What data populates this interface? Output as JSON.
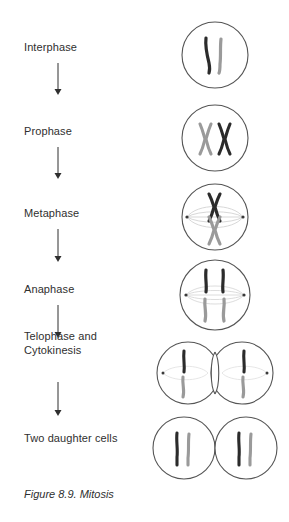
{
  "figure": {
    "caption": "Figure 8.9. Mitosis",
    "title": "Mitosis",
    "number": "Figure 8.9."
  },
  "colors": {
    "chromosome_dark": "#2b2b2b",
    "chromosome_light": "#9a9a9a",
    "cell_membrane": "#555555",
    "spindle": "#cfcfcf",
    "centrosome": "#3a3a3a",
    "text": "#2f2f2f",
    "arrow": "#2f2f2f",
    "background": "#ffffff"
  },
  "stages": [
    {
      "id": "interphase",
      "label": "Interphase",
      "label_x": 24,
      "label_y": 47,
      "cell_cx": 215,
      "cell_cy": 55,
      "cell_r": 33,
      "chromosome_shape": "uncondensed-strands",
      "chromosome_count": 2,
      "has_spindle": false,
      "has_centrosomes": false
    },
    {
      "id": "prophase",
      "label": "Prophase",
      "label_x": 24,
      "label_y": 131,
      "cell_cx": 215,
      "cell_cy": 138,
      "cell_r": 33,
      "chromosome_shape": "condensed-x-pair-side-by-side",
      "chromosome_count": 2,
      "has_spindle": false,
      "has_centrosomes": false
    },
    {
      "id": "metaphase",
      "label": "Metaphase",
      "label_x": 24,
      "label_y": 213,
      "cell_cx": 215,
      "cell_cy": 217,
      "cell_r": 33,
      "chromosome_shape": "condensed-x-aligned-equator",
      "chromosome_count": 2,
      "has_spindle": true,
      "has_centrosomes": true
    },
    {
      "id": "anaphase",
      "label": "Anaphase",
      "label_x": 24,
      "label_y": 289,
      "cell_cx": 215,
      "cell_cy": 295,
      "cell_r": 35,
      "chromosome_shape": "separated-chromatids",
      "chromosome_count": 4,
      "has_spindle": true,
      "has_centrosomes": true
    },
    {
      "id": "telophase-cytokinesis",
      "label": "Telophase and\nCytokinesis",
      "label_x": 24,
      "label_y": 336,
      "cell_cx": 215,
      "cell_cy": 373,
      "cell_r": 31,
      "chromosome_shape": "two-nuclei-cleavage-furrow",
      "chromosome_count": 4,
      "has_spindle": true,
      "has_centrosomes": true
    },
    {
      "id": "two-daughter-cells",
      "label": "Two daughter cells",
      "label_x": 24,
      "label_y": 438,
      "cell_cx": 215,
      "cell_cy": 448,
      "cell_r": 31,
      "chromosome_shape": "uncondensed-strands-two-cells",
      "chromosome_count": 4,
      "has_spindle": false,
      "has_centrosomes": false
    }
  ],
  "arrows": [
    {
      "id": "arrow-interphase-prophase",
      "x": 58,
      "y1": 63,
      "y2": 94
    },
    {
      "id": "arrow-prophase-metaphase",
      "x": 58,
      "y1": 147,
      "y2": 178
    },
    {
      "id": "arrow-metaphase-anaphase",
      "x": 58,
      "y1": 229,
      "y2": 262
    },
    {
      "id": "arrow-anaphase-telophase",
      "x": 58,
      "y1": 305,
      "y2": 338
    },
    {
      "id": "arrow-telophase-daughter",
      "x": 58,
      "y1": 382,
      "y2": 416
    }
  ]
}
